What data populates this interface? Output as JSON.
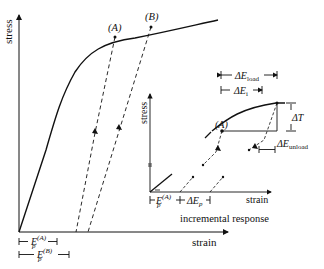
{
  "main_plot": {
    "y_label": "stress",
    "x_label": "strain",
    "point_a": "(A)",
    "point_b": "(B)",
    "ep_a_base": "E",
    "ep_a_sub": "p",
    "ep_a_sup": "(A)",
    "ep_b_base": "E",
    "ep_b_sub": "p",
    "ep_b_sup": "(B)"
  },
  "inset_plot": {
    "y_label": "stress",
    "x_label": "strain",
    "caption": "incremental response",
    "point_a": "(A)",
    "delta_e_load": "ΔE",
    "delta_e_load_sub": "load",
    "delta_e_i": "ΔE",
    "delta_e_i_sub": "i",
    "delta_t": "ΔT",
    "delta_e_unload": "ΔE",
    "delta_e_unload_sub": "unload",
    "ep_a_base": "E",
    "ep_a_sub": "p",
    "ep_a_sup": "(A)",
    "delta_ep_base": "ΔE",
    "delta_ep_sub": "p"
  },
  "colors": {
    "stroke": "#111111",
    "background": "#ffffff"
  }
}
